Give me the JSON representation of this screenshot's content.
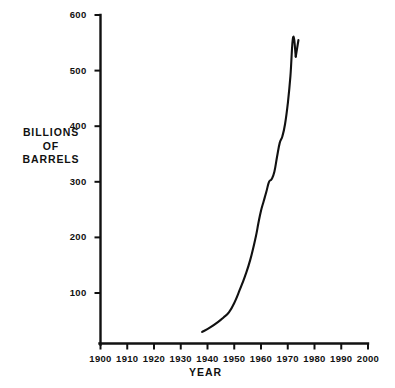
{
  "chart_data": {
    "type": "line",
    "title": "",
    "xlabel": "YEAR",
    "ylabel": "BILLIONS OF BARRELS",
    "ylabel_lines": [
      "BILLIONS",
      "OF",
      "BARRELS"
    ],
    "xlim": [
      1900,
      2000
    ],
    "ylim": [
      0,
      600
    ],
    "grid": false,
    "legend": null,
    "xticks": [
      1900,
      1910,
      1920,
      1930,
      1940,
      1950,
      1960,
      1970,
      1980,
      1990,
      2000
    ],
    "xtick_labels": [
      "1900",
      "1910",
      "1920",
      "1930",
      "1940",
      "1950",
      "1960",
      "1970",
      "1980",
      "1990",
      "2000"
    ],
    "yticks": [
      100,
      200,
      300,
      400,
      500,
      600
    ],
    "ytick_labels": [
      "100",
      "200",
      "300",
      "400",
      "500",
      "600"
    ],
    "line_color": "#111111",
    "line_width": 2.1,
    "series": [
      {
        "name": "Proved reserves",
        "x": [
          1938,
          1941,
          1944,
          1946,
          1948,
          1950,
          1952,
          1954,
          1956,
          1958,
          1959,
          1960,
          1961,
          1962,
          1963,
          1964,
          1965,
          1966,
          1967,
          1968,
          1969,
          1970,
          1971,
          1972,
          1973
        ],
        "values": [
          30,
          38,
          48,
          56,
          65,
          82,
          105,
          130,
          160,
          200,
          225,
          248,
          265,
          282,
          300,
          305,
          318,
          345,
          370,
          382,
          404,
          440,
          490,
          560,
          525
        ]
      }
    ],
    "annotations": [
      {
        "text": "final upturn",
        "x": 1974,
        "y": 555
      }
    ],
    "tail_x": [
      1973,
      1974
    ],
    "tail_values": [
      525,
      555
    ]
  },
  "axis": {
    "ytitle_line1": "BILLIONS",
    "ytitle_line2": "OF",
    "ytitle_line3": "BARRELS",
    "xtitle": "YEAR"
  },
  "caption_ghost": ""
}
